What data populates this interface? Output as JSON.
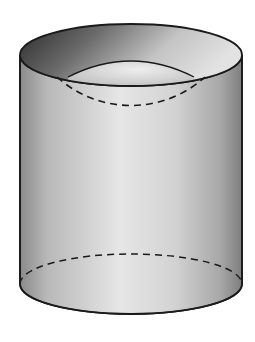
{
  "figure": {
    "cylinder": {
      "left_x": 20,
      "right_x": 242,
      "center_x": 131,
      "top_center_y": 55,
      "top_rx": 111,
      "top_ry": 31,
      "bottom_center_y": 284,
      "bottom_rx": 111,
      "bottom_ry": 30,
      "body_light": "#f2f2f2",
      "body_mid": "#c9c9c9",
      "body_dark": "#8c8c8c",
      "inner_dark": "#3a3a3a",
      "outline": "#1a1a1a"
    },
    "sphere": {
      "center_x": 131,
      "center_y": 170,
      "r": 111,
      "dash": "7,5",
      "stroke": "#1a1a1a"
    }
  }
}
